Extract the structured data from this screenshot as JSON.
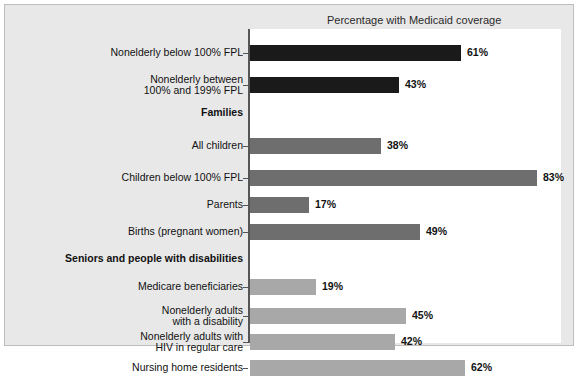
{
  "chart_title": "Percentage with Medicaid coverage",
  "colors": {
    "page_background": "#ffffff",
    "panel_background": "#e8e8e8",
    "panel_border": "#bdbdbd",
    "plot_background": "#ffffff",
    "axis": "#555555",
    "group_nonelderly": "#1a1a1a",
    "group_families": "#6e6e6e",
    "group_seniors": "#a8a8a8",
    "label_text": "#111111"
  },
  "chart_data": {
    "type": "bar",
    "orientation": "horizontal",
    "title": "Percentage with Medicaid coverage",
    "xlabel": "",
    "ylabel": "",
    "xlim": [
      0,
      90
    ],
    "grid": false,
    "legend": "none",
    "value_suffix": "%",
    "rows": [
      {
        "kind": "bar",
        "label": "Nonelderly below 100% FPL",
        "value": 61,
        "display": "61%",
        "group": "nonelderly"
      },
      {
        "kind": "bar",
        "label": "Nonelderly between\n100% and 199% FPL",
        "value": 43,
        "display": "43%",
        "group": "nonelderly"
      },
      {
        "kind": "section",
        "label": "Families"
      },
      {
        "kind": "bar",
        "label": "All children",
        "value": 38,
        "display": "38%",
        "group": "families"
      },
      {
        "kind": "bar",
        "label": "Children below 100% FPL",
        "value": 83,
        "display": "83%",
        "group": "families"
      },
      {
        "kind": "bar",
        "label": "Parents",
        "value": 17,
        "display": "17%",
        "group": "families"
      },
      {
        "kind": "bar",
        "label": "Births (pregnant women)",
        "value": 49,
        "display": "49%",
        "group": "families"
      },
      {
        "kind": "section",
        "label": "Seniors and people with disabilities"
      },
      {
        "kind": "bar",
        "label": "Medicare beneficiaries",
        "value": 19,
        "display": "19%",
        "group": "seniors"
      },
      {
        "kind": "bar",
        "label": "Nonelderly adults\nwith a disability",
        "value": 45,
        "display": "45%",
        "group": "seniors"
      },
      {
        "kind": "bar",
        "label": "Nonelderly adults with\nHIV in regular care",
        "value": 42,
        "display": "42%",
        "group": "seniors"
      },
      {
        "kind": "bar",
        "label": "Nursing home residents",
        "value": 62,
        "display": "62%",
        "group": "seniors"
      }
    ]
  }
}
